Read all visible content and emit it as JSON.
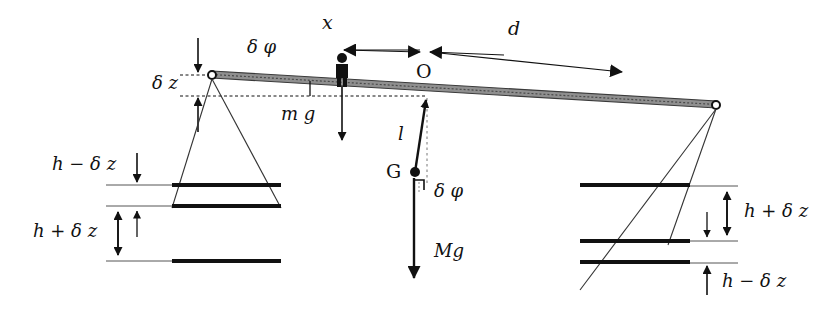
{
  "figure": {
    "type": "physics-schematic",
    "colors": {
      "ink": "#111111",
      "beam_fill": "#8c8c8c",
      "thin_line": "#555555",
      "background": "#ffffff"
    }
  },
  "labels": {
    "delta_phi_beam": "δ φ",
    "delta_phi_pendulum": "δ φ",
    "delta_z": "δ z",
    "x": "x",
    "d": "d",
    "O": "O",
    "G": "G",
    "l": "l",
    "mg": "m g",
    "Mg": "Mg",
    "h_minus_dz_left": "h − δ z",
    "h_plus_dz_left": "h + δ z",
    "h_plus_dz_right": "h + δ z",
    "h_minus_dz_right": "h − δ z"
  },
  "geometry": {
    "beam": {
      "left_pivot": [
        212,
        75
      ],
      "right_pivot": [
        716,
        105
      ],
      "tilt_note": "beam tilts down to the right by δφ"
    },
    "rider": {
      "x": 342,
      "top": 54,
      "bottom": 86,
      "label": "m g"
    },
    "fulcrum_O": [
      425,
      96
    ],
    "bob_G": [
      415,
      172
    ],
    "pendulum_rod_length_label": "l",
    "dimension_arrows": {
      "x_span": [
        342,
        425
      ],
      "d_span": [
        425,
        620
      ],
      "delta_z_top": 40,
      "delta_z_bottom": 96
    },
    "left_pan": {
      "bars_y": [
        185,
        206,
        261
      ],
      "x_from": 172,
      "x_to": 281
    },
    "right_pan": {
      "bars_y": [
        185,
        241,
        262
      ],
      "x_from": 580,
      "x_to": 690
    }
  }
}
